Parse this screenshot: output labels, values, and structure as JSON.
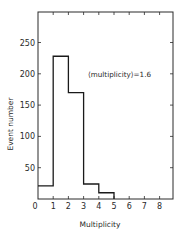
{
  "chart_data": {
    "type": "bar",
    "subtype": "histogram-step",
    "title": "",
    "xlabel": "Multiplicity",
    "ylabel": "Event number",
    "bin_edges": [
      0,
      1,
      2,
      3,
      4,
      5
    ],
    "categories": [
      "0-1",
      "1-2",
      "2-3",
      "3-4",
      "4-5"
    ],
    "values": [
      21,
      228,
      170,
      24,
      10
    ],
    "xlim": [
      0,
      9
    ],
    "ylim": [
      0,
      300
    ],
    "x_ticks": [
      0,
      1,
      2,
      3,
      4,
      5,
      6,
      7,
      8
    ],
    "x_tick_labels": [
      "0",
      "1",
      "2",
      "3",
      "4",
      "5",
      "6",
      "7",
      "8"
    ],
    "y_ticks": [
      50,
      100,
      150,
      200,
      250
    ],
    "y_tick_labels": [
      "50",
      "100",
      "150",
      "200",
      "250"
    ],
    "grid": false,
    "legend": null,
    "annotations": [
      {
        "text": "⟨multiplicity⟩=1.6",
        "x": 5.2,
        "y": 200
      }
    ],
    "mirror_ticks": true
  },
  "labels": {
    "xlabel": "Multiplicity",
    "ylabel": "Event number",
    "annotation": "⟨multiplicity⟩=1.6",
    "x_ticks": [
      "0",
      "1",
      "2",
      "3",
      "4",
      "5",
      "6",
      "7",
      "8"
    ],
    "y_ticks": [
      "50",
      "100",
      "150",
      "200",
      "250"
    ]
  }
}
